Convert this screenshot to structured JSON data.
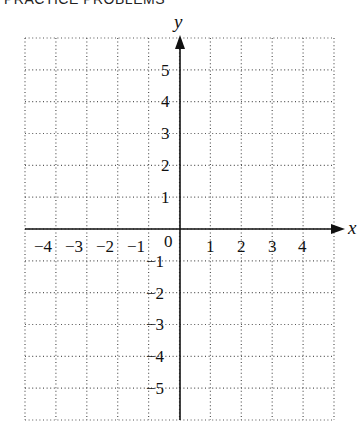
{
  "header": {
    "title": "PRACTICE PROBLEMS"
  },
  "graph": {
    "x_axis_label": "x",
    "y_axis_label": "y",
    "origin_label": "0",
    "x_ticks_negative": [
      "−4",
      "−3",
      "−2",
      "−1"
    ],
    "x_ticks_positive": [
      "1",
      "2",
      "3",
      "4"
    ],
    "y_ticks_positive": [
      "5",
      "4",
      "3",
      "2",
      "1"
    ],
    "y_ticks_negative": [
      "−1",
      "−2",
      "−3",
      "−4",
      "−5"
    ],
    "grid": {
      "x_min": -5,
      "x_max": 5,
      "y_min": -6,
      "y_max": 6,
      "style": "dotted"
    }
  }
}
